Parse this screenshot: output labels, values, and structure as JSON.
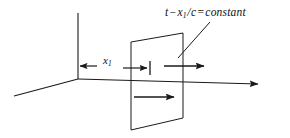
{
  "figure": {
    "background_color": "#ffffff",
    "ink_color": "#1a1a1a",
    "width": 290,
    "height": 138
  },
  "labels": {
    "equation": {
      "full_text": "t − x₁ / c = constant",
      "lhs_var": "t",
      "minus": "−",
      "numerator": "x",
      "numerator_subscript": "1",
      "slash": "/",
      "denominator": "c",
      "equals": "=",
      "rhs": "constant"
    },
    "distance": {
      "symbol": "x",
      "subscript": "1"
    }
  },
  "axes": {
    "vertical": {
      "name": "vertical-axis"
    },
    "horizontal": {
      "name": "horizontal-axis",
      "has_arrowhead": true
    },
    "depth": {
      "name": "depth-axis"
    }
  },
  "elements": {
    "plane": {
      "name": "wavefront-plane"
    },
    "dim_arrow_left": {
      "name": "dimension-arrow-left"
    },
    "dim_arrow_right": {
      "name": "dimension-arrow-right"
    },
    "flow_arrow_upper": {
      "name": "propagation-arrow-upper"
    },
    "flow_arrow_lower": {
      "name": "propagation-arrow-lower"
    },
    "leader": {
      "name": "equation-leader-line"
    },
    "tick": {
      "name": "dimension-tick"
    }
  }
}
